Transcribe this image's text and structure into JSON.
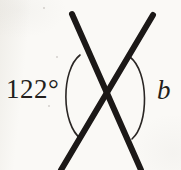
{
  "figure": {
    "kind": "geometry-diagram",
    "background_color": "#faf9f6",
    "ink_color": "#1b1817",
    "canvas": {
      "width": 181,
      "height": 170
    }
  },
  "labels": {
    "left_angle": "122°",
    "right_angle": "b"
  },
  "lines": [
    {
      "name": "line-top-left-to-bottom-right",
      "start": {
        "x": 72,
        "y": 14
      },
      "end": {
        "x": 141,
        "y": 170
      },
      "stroke_width": 6
    },
    {
      "name": "line-top-right-to-bottom-left",
      "start": {
        "x": 153,
        "y": 15
      },
      "end": {
        "x": 61,
        "y": 170
      },
      "stroke_width": 6
    }
  ],
  "intersection": {
    "x": 106,
    "y": 96
  },
  "arcs": [
    {
      "name": "left-angle-arc",
      "marks": "122°",
      "start": {
        "x": 80,
        "y": 55
      },
      "end": {
        "x": 81,
        "y": 139
      },
      "bulge_x": 61,
      "stroke_width": 1.6
    },
    {
      "name": "right-angle-arc",
      "marks": "b",
      "start": {
        "x": 130,
        "y": 57
      },
      "end": {
        "x": 132,
        "y": 139
      },
      "bulge_x": 149,
      "stroke_width": 1.6
    }
  ],
  "marks": [
    {
      "name": "paper-speck-upper-left",
      "x": 56,
      "y": 56,
      "w": 2,
      "h": 2
    },
    {
      "name": "paper-speck-mid-left",
      "x": 48,
      "y": 105,
      "w": 2,
      "h": 2
    },
    {
      "name": "paper-speck-upper",
      "x": 43,
      "y": 7,
      "w": 2,
      "h": 2
    }
  ]
}
